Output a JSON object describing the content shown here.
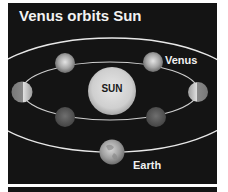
{
  "figure": {
    "title": "Venus orbits Sun",
    "labels": {
      "sun": "SUN",
      "venus": "Venus",
      "earth": "Earth"
    },
    "colors": {
      "background": "#141414",
      "orbit": "#e8e8e8",
      "sun": "#d4d4d4",
      "text": "#f2f2f2"
    },
    "bodies": [
      {
        "name": "Sun",
        "type": "star",
        "position": "center"
      },
      {
        "name": "Venus",
        "type": "planet",
        "count": 6,
        "positions": [
          "upper-left",
          "upper-right",
          "left",
          "right",
          "lower-left",
          "lower-right"
        ]
      },
      {
        "name": "Earth",
        "type": "planet",
        "position": "bottom of outer orbit"
      }
    ],
    "orbits": [
      {
        "name": "Venus orbit",
        "type": "inner ellipse"
      },
      {
        "name": "Earth orbit",
        "type": "outer ellipse"
      }
    ]
  }
}
